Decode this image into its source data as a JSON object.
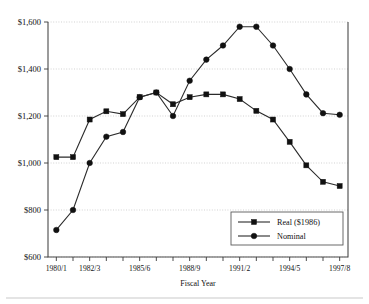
{
  "chart_data": {
    "type": "line",
    "title": "",
    "xlabel": "Fiscal Year",
    "ylabel": "",
    "ylim": [
      600,
      1600
    ],
    "ytick_values": [
      600,
      800,
      1000,
      1200,
      1400,
      1600
    ],
    "ytick_labels": [
      "$600",
      "$800",
      "$1,000",
      "$1,200",
      "$1,400",
      "$1,600"
    ],
    "grid": true,
    "grid_axis": "y",
    "legend_position": "bottom-right",
    "categories": [
      "1980/1",
      "1981/2",
      "1982/3",
      "1983/4",
      "1984/5",
      "1985/6",
      "1986/7",
      "1987/8",
      "1988/9",
      "1989/90",
      "1990/1",
      "1991/2",
      "1992/3",
      "1993/4",
      "1994/5",
      "1995/6",
      "1996/7",
      "1997/8"
    ],
    "xtick_labels": [
      "1980/1",
      "1982/3",
      "1985/6",
      "1988/9",
      "1991/2",
      "1994/5",
      "1997/8"
    ],
    "xtick_label_indices": [
      0,
      2,
      5,
      8,
      11,
      14,
      17
    ],
    "series": [
      {
        "name": "Real ($1986)",
        "marker": "square",
        "values": [
          1025,
          1025,
          1185,
          1220,
          1208,
          1280,
          1300,
          1250,
          1280,
          1292,
          1292,
          1272,
          1222,
          1185,
          1090,
          990,
          920,
          902
        ]
      },
      {
        "name": "Nominal",
        "marker": "circle",
        "values": [
          715,
          800,
          1000,
          1112,
          1132,
          1280,
          1300,
          1200,
          1350,
          1440,
          1500,
          1580,
          1580,
          1500,
          1400,
          1292,
          1212,
          1205
        ]
      }
    ]
  },
  "legend": {
    "entries": [
      {
        "label": "Real ($1986)",
        "marker": "square"
      },
      {
        "label": "Nominal",
        "marker": "circle"
      }
    ]
  },
  "axis": {
    "x_title": "Fiscal Year"
  },
  "colors": {
    "line": "#2b2b2b",
    "marker": "#111111",
    "grid": "#bfbfbf",
    "frame": "#4a4a4a",
    "background": "#ffffff"
  }
}
